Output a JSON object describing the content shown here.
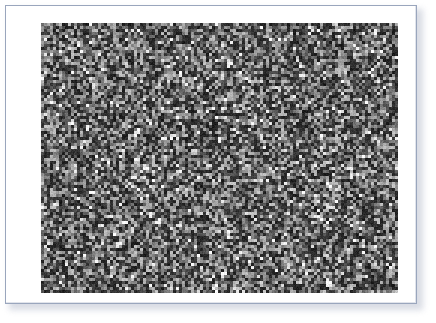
{
  "panel": {
    "background_color": "#ffffff",
    "border_color": "#9aa6bd",
    "shadow_color": "#b9bfce",
    "label": "Figure panel"
  },
  "figure": {
    "name": "grayscale-random-noise-image",
    "alt_text": "Grayscale random noise image",
    "caption": "",
    "rendering": "pixelated"
  },
  "chart_data": {
    "type": "heatmap",
    "title": "",
    "subtitle": "",
    "xlabel": "",
    "ylabel": "",
    "legend": [],
    "annotations": [],
    "grid": false,
    "colormap": "grayscale",
    "value_min": 0,
    "value_max": 255,
    "cell_size_px": 3,
    "cols": 119,
    "rows": 90,
    "width_px": 357,
    "height_px": 270,
    "distribution": "uniform-random-gray",
    "mean_level": 96,
    "dark_level": 26,
    "mid_level": 104,
    "light_level": 168,
    "highlight_level": 255,
    "highlight_fraction": 0.045,
    "dark_fraction": 0.22,
    "seed": 20240917
  }
}
